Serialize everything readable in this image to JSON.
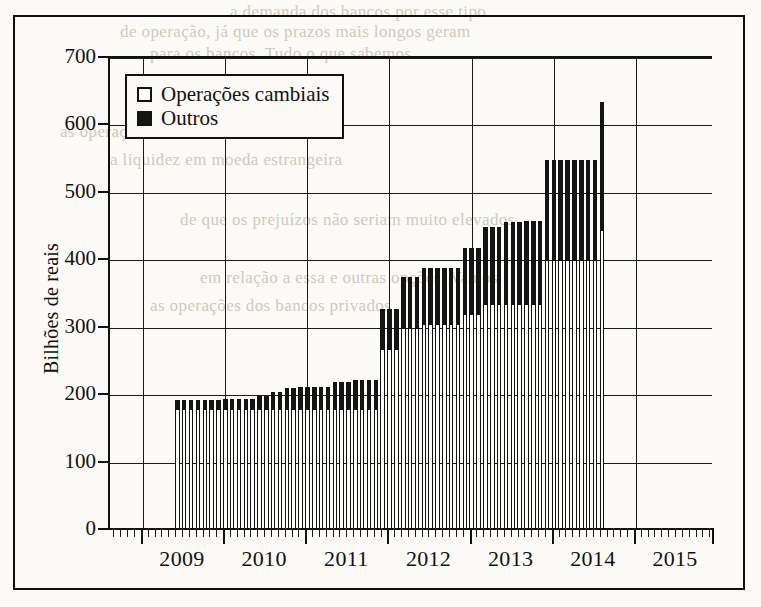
{
  "chart_data": {
    "type": "bar",
    "subtype": "stacked-bar",
    "title": "",
    "xlabel": "",
    "ylabel": "Bilhões de reais",
    "ylim": [
      0,
      700
    ],
    "yticks": [
      0,
      100,
      200,
      300,
      400,
      500,
      600,
      700
    ],
    "ytick_labels": [
      "0",
      "100",
      "200",
      "300",
      "400",
      "500",
      "600",
      "700"
    ],
    "xlim_years": [
      2008.6,
      2015.95
    ],
    "xticks": [
      2009,
      2010,
      2011,
      2012,
      2013,
      2014,
      2015
    ],
    "xtick_labels": [
      "2009",
      "2010",
      "2011",
      "2012",
      "2013",
      "2014",
      "2015"
    ],
    "minor_xticks": "monthly",
    "grid": "horizontal-and-vertical",
    "legend_position": "upper-left-inside",
    "series": [
      {
        "name": "Operações cambiais",
        "color": "#ffffff",
        "edge_color": "#121212",
        "stack_order": 0,
        "values": [
          180,
          180,
          180,
          180,
          180,
          180,
          180,
          180,
          180,
          180,
          180,
          180,
          180,
          180,
          180,
          180,
          180,
          180,
          180,
          180,
          180,
          180,
          180,
          180,
          180,
          180,
          180,
          180,
          180,
          180,
          268,
          268,
          268,
          300,
          300,
          300,
          305,
          305,
          305,
          305,
          305,
          305,
          320,
          320,
          320,
          335,
          335,
          335,
          335,
          335,
          335,
          335,
          335,
          335,
          400,
          400,
          400,
          400,
          400,
          400,
          400,
          400,
          445
        ]
      },
      {
        "name": "Outros",
        "color": "#151515",
        "edge_color": "#121212",
        "stack_order": 1,
        "values": [
          13,
          13,
          13,
          13,
          13,
          13,
          13,
          15,
          15,
          15,
          15,
          15,
          18,
          18,
          25,
          25,
          30,
          30,
          32,
          32,
          32,
          32,
          32,
          40,
          40,
          40,
          42,
          42,
          42,
          42,
          60,
          60,
          60,
          75,
          75,
          75,
          83,
          83,
          83,
          83,
          83,
          83,
          98,
          98,
          98,
          115,
          115,
          115,
          122,
          122,
          122,
          123,
          123,
          123,
          148,
          148,
          148,
          148,
          148,
          148,
          148,
          148,
          190
        ]
      }
    ],
    "totals": [
      193,
      193,
      193,
      193,
      193,
      193,
      193,
      195,
      195,
      195,
      195,
      195,
      198,
      198,
      205,
      205,
      210,
      210,
      212,
      212,
      212,
      212,
      212,
      220,
      220,
      220,
      222,
      222,
      222,
      222,
      328,
      328,
      328,
      375,
      375,
      375,
      388,
      388,
      388,
      388,
      388,
      388,
      418,
      418,
      418,
      450,
      450,
      450,
      457,
      457,
      457,
      458,
      458,
      458,
      548,
      548,
      548,
      548,
      548,
      548,
      548,
      548,
      635
    ],
    "x_start_year": 2009.42,
    "x_step_years": 0.0833
  },
  "legend": {
    "items": [
      {
        "label": "Operações cambiais",
        "swatch": "white"
      },
      {
        "label": "Outros",
        "swatch": "black"
      }
    ]
  },
  "axis": {
    "y_title": "Bilhões de reais"
  },
  "ghost_text": [
    {
      "text": "a demanda dos bancos por esse tipo",
      "x": 230,
      "y": 2
    },
    {
      "text": "de operação, já que os prazos mais longos geram",
      "x": 120,
      "y": 22
    },
    {
      "text": "para os bancos. Tudo o que sabemos",
      "x": 150,
      "y": 44
    },
    {
      "text": "as operações cambiais",
      "x": 60,
      "y": 122
    },
    {
      "text": "a liquidez em moeda estrangeira",
      "x": 110,
      "y": 150
    },
    {
      "text": "de que os prejuízos não seriam muito elevados",
      "x": 180,
      "y": 210
    },
    {
      "text": "em relação a essa e outras opções. Vamos",
      "x": 200,
      "y": 268
    },
    {
      "text": "as operações dos bancos privados",
      "x": 150,
      "y": 296
    }
  ]
}
